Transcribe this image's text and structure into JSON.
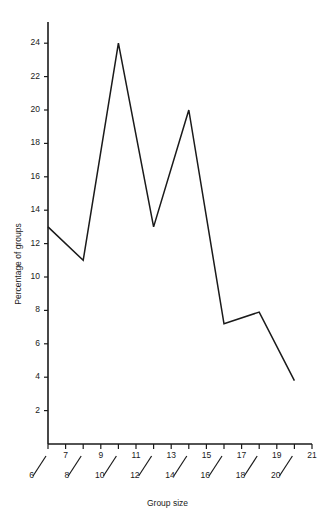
{
  "chart_data": {
    "type": "line",
    "title": "",
    "subtitle": "",
    "xlabel": "Group size",
    "ylabel": "Percentage of groups",
    "x": [
      6,
      8,
      10,
      12,
      14,
      16,
      18,
      20
    ],
    "values": [
      13.0,
      11.0,
      24.0,
      13.0,
      20.0,
      7.2,
      7.9,
      3.8
    ],
    "series": [
      {
        "name": "Percentage of groups",
        "values": [
          13.0,
          11.0,
          24.0,
          13.0,
          20.0,
          7.2,
          7.9,
          3.8
        ]
      }
    ],
    "xlim": [
      6,
      21
    ],
    "ylim": [
      0,
      25
    ],
    "x_tick_values": [
      7,
      9,
      11,
      13,
      15,
      17,
      19,
      21
    ],
    "x_tick_labels": [
      "7",
      "9",
      "11",
      "13",
      "15",
      "17",
      "19",
      "21"
    ],
    "x_offset_tick_values": [
      6,
      8,
      10,
      12,
      14,
      16,
      18,
      20
    ],
    "x_offset_tick_labels": [
      "6",
      "8",
      "10",
      "12",
      "14",
      "16",
      "18",
      "20"
    ],
    "y_tick_values": [
      2,
      4,
      6,
      8,
      10,
      12,
      14,
      16,
      18,
      20,
      22,
      24
    ],
    "y_tick_labels": [
      "2",
      "4",
      "6",
      "8",
      "10",
      "12",
      "14",
      "16",
      "18",
      "20",
      "22",
      "24"
    ],
    "grid": false,
    "legend": false,
    "legend_position": "none",
    "line_color": "#1a1a1a",
    "axis_color": "#1a1a1a",
    "background_color": "#ffffff"
  },
  "axes": {
    "x_title": "Group size",
    "y_title": "Percentage of groups"
  }
}
